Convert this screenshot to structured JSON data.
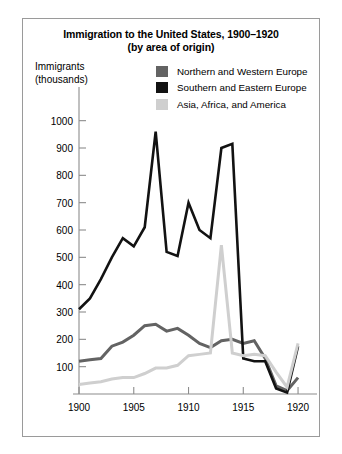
{
  "figure": {
    "title_lines": [
      "Immigration to the United States, 1900–1920",
      "(by area of origin)"
    ],
    "axis_caption_lines": [
      "Immigrants",
      "(thousands)"
    ],
    "border_color": "#9a9a9a",
    "background": "#ffffff"
  },
  "legend": {
    "position": "top-right-inside",
    "entries": [
      {
        "label": "Northern and Western Europe",
        "color": "#636363",
        "swatch": "legend-swatch-northern-western-europe"
      },
      {
        "label": "Southern and Eastern Europe",
        "color": "#121212",
        "swatch": "legend-swatch-southern-eastern-europe"
      },
      {
        "label": "Asia, Africa, and America",
        "color": "#cfcfcf",
        "swatch": "legend-swatch-asia-africa-america"
      }
    ]
  },
  "chart_data": {
    "type": "line",
    "title": "Immigration to the United States, 1900–1920 (by area of origin)",
    "subtitle": "(by area of origin)",
    "xlabel": "",
    "ylabel": "Immigrants (thousands)",
    "xlim": [
      1900,
      1921
    ],
    "ylim": [
      0,
      1050
    ],
    "grid": false,
    "legend_position": "top-right",
    "x": [
      1900,
      1901,
      1902,
      1903,
      1904,
      1905,
      1906,
      1907,
      1908,
      1909,
      1910,
      1911,
      1912,
      1913,
      1914,
      1915,
      1916,
      1917,
      1918,
      1919,
      1920
    ],
    "xticks": [
      1900,
      1905,
      1910,
      1915,
      1920
    ],
    "xtick_labels": [
      "1900",
      "1905",
      "1910",
      "1915",
      "1920"
    ],
    "yticks": [
      100,
      200,
      300,
      400,
      500,
      600,
      700,
      800,
      900,
      1000
    ],
    "ytick_labels": [
      "100",
      "200",
      "300",
      "400",
      "500",
      "600",
      "700",
      "800",
      "900",
      "1000"
    ],
    "series": [
      {
        "name": "Northern and Western Europe",
        "color": "#636363",
        "values": [
          120,
          125,
          130,
          175,
          190,
          215,
          250,
          255,
          230,
          240,
          215,
          185,
          170,
          195,
          200,
          185,
          195,
          130,
          30,
          12,
          60
        ]
      },
      {
        "name": "Southern and Eastern Europe",
        "color": "#121212",
        "values": [
          310,
          350,
          420,
          500,
          570,
          540,
          610,
          960,
          520,
          505,
          700,
          600,
          570,
          900,
          915,
          130,
          120,
          120,
          20,
          5,
          175
        ]
      },
      {
        "name": "Asia, Africa, and America",
        "color": "#cfcfcf",
        "values": [
          35,
          40,
          45,
          55,
          60,
          60,
          75,
          95,
          95,
          105,
          140,
          145,
          150,
          545,
          150,
          140,
          145,
          140,
          80,
          25,
          185
        ]
      }
    ]
  }
}
